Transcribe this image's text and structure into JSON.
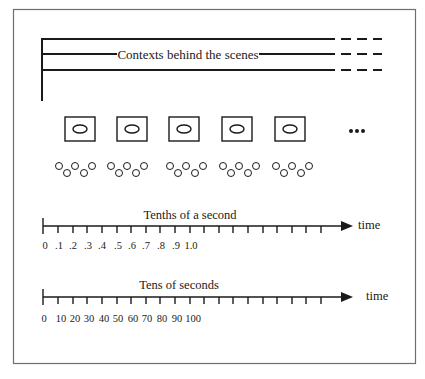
{
  "figure": {
    "frame_color": "#6e6e6e",
    "ink_color": "#1a1a1a",
    "contexts": {
      "label": "Contexts behind the scenes",
      "line_count": 3
    },
    "scenes": {
      "box_count": 5,
      "continuation": "…",
      "circle_groups": 5,
      "circles_per_group": 5
    },
    "timelines": [
      {
        "title": "Tenths of a second",
        "axis_label": "time",
        "tick_labels": [
          "0",
          ".1",
          ".2",
          ".3",
          ".4",
          ".5",
          ".6",
          ".7",
          ".8",
          ".9",
          "1.0"
        ]
      },
      {
        "title": "Tens of seconds",
        "axis_label": "time",
        "tick_labels": [
          "0",
          "10",
          "20",
          "30",
          "40",
          "50",
          "60",
          "70",
          "80",
          "90",
          "100"
        ]
      }
    ]
  }
}
